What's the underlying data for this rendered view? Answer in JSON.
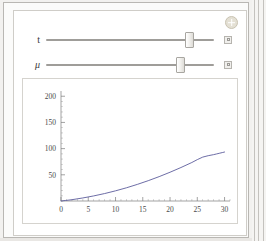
{
  "window": {
    "app_style": "manipulate-widget",
    "background_color": "#f2f1ef",
    "panel_color": "#ffffff",
    "border_color": "#cfcdc8"
  },
  "controls": {
    "add_control": {
      "icon": "plus-circle-icon",
      "label": "+",
      "tooltip": "Show controls"
    },
    "sliders": [
      {
        "label": "t",
        "italic": false,
        "value_fraction": 0.875,
        "animate_icon": "animate-square-icon"
      },
      {
        "label": "μ",
        "italic": true,
        "value_fraction": 0.815,
        "animate_icon": "animate-square-icon"
      }
    ]
  },
  "chart_data": {
    "type": "line",
    "title": "",
    "xlabel": "",
    "ylabel": "",
    "xlim": [
      0,
      31
    ],
    "ylim": [
      0,
      210
    ],
    "grid": false,
    "legend": null,
    "line_color": "#5c5c9c",
    "line_width": 0.9,
    "x_ticks": [
      0,
      5,
      10,
      15,
      20,
      25,
      30
    ],
    "x_tick_labels": [
      "0",
      "5",
      "10",
      "15",
      "20",
      "25",
      "30"
    ],
    "x_minor_tick_step": 1,
    "y_ticks": [
      50,
      100,
      150,
      200
    ],
    "y_tick_labels": [
      "50",
      "100",
      "150",
      "200"
    ],
    "y_minor_tick_step": 10,
    "series": [
      {
        "name": "curve",
        "x": [
          0,
          2,
          4,
          6,
          8,
          10,
          12,
          14,
          16,
          18,
          20,
          22,
          24,
          26,
          28,
          30
        ],
        "y": [
          0,
          2.5,
          5.8,
          9.7,
          14.2,
          19.4,
          25.2,
          31.7,
          38.8,
          46.5,
          54.9,
          63.9,
          73.5,
          83.8,
          88.5,
          93.5
        ]
      }
    ]
  }
}
